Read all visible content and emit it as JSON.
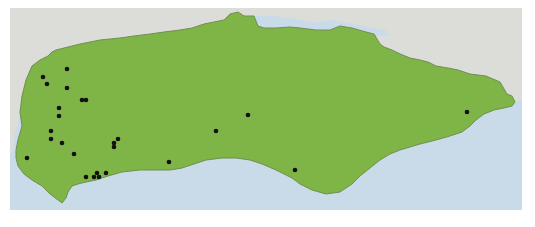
{
  "map": {
    "type": "point-distribution-map",
    "region": "coastal region (land mass bordered by sea to south and neighbouring land to north)",
    "frame": {
      "x": 10,
      "y": 8,
      "width": 512,
      "height": 202
    },
    "colors": {
      "land": "#7fb446",
      "land_border": "#6f8f52",
      "neighbouring_land": "#dcdcd8",
      "sea": "#c9dbe8",
      "point": "#111111",
      "background": "#ffffff"
    },
    "points": [
      {
        "x": 67,
        "y": 69
      },
      {
        "x": 43,
        "y": 77
      },
      {
        "x": 47,
        "y": 84
      },
      {
        "x": 67,
        "y": 88
      },
      {
        "x": 82,
        "y": 100
      },
      {
        "x": 86,
        "y": 100
      },
      {
        "x": 59,
        "y": 108
      },
      {
        "x": 59,
        "y": 116
      },
      {
        "x": 51,
        "y": 131
      },
      {
        "x": 51,
        "y": 139
      },
      {
        "x": 62,
        "y": 143
      },
      {
        "x": 74,
        "y": 154
      },
      {
        "x": 27,
        "y": 158
      },
      {
        "x": 118,
        "y": 139
      },
      {
        "x": 114,
        "y": 143
      },
      {
        "x": 114,
        "y": 147
      },
      {
        "x": 169,
        "y": 162
      },
      {
        "x": 86,
        "y": 177
      },
      {
        "x": 94,
        "y": 177
      },
      {
        "x": 97,
        "y": 173
      },
      {
        "x": 99,
        "y": 177
      },
      {
        "x": 106,
        "y": 173
      },
      {
        "x": 248,
        "y": 115
      },
      {
        "x": 216,
        "y": 131
      },
      {
        "x": 295,
        "y": 170
      },
      {
        "x": 467,
        "y": 112
      }
    ],
    "point_count": 26
  }
}
